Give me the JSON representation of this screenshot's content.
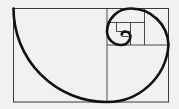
{
  "figure": {
    "name": "golden-spiral-diagram",
    "background_color": "#f2f1ef",
    "stroke_color": "#1a1a1a",
    "rect_stroke_color": "#3a3a3a",
    "spiral_stroke_color": "#111111",
    "spiral_stroke_width": 2.6,
    "square_stroke_width": 0.9,
    "outer_rect": {
      "x": 13.5,
      "y": 8.5,
      "width": 155,
      "height": 93.5
    },
    "squares": [
      {
        "label": "square-1",
        "x": 13.5,
        "y": 8.5,
        "size": 93.5,
        "fib": 89
      },
      {
        "label": "square-2",
        "x": 107.0,
        "y": 8.5,
        "size": 61.5,
        "fib": 55
      },
      {
        "label": "square-3",
        "x": 107.0,
        "y": 8.5,
        "size": 37.5,
        "fib": 34
      },
      {
        "label": "square-4",
        "x": 107.0,
        "y": 22.5,
        "size": 23.5,
        "fib": 21
      },
      {
        "label": "square-5",
        "x": 116.5,
        "y": 22.5,
        "size": 14.0,
        "fib": 13
      },
      {
        "label": "square-6",
        "x": 116.5,
        "y": 31.5,
        "size": 9.0,
        "fib": 8
      },
      {
        "label": "square-7",
        "x": 122.0,
        "y": 31.5,
        "size": 5.5,
        "fib": 5
      }
    ],
    "divider_lines": [
      {
        "label": "divider-vertical-main",
        "x1": 107.0,
        "y1": 8.5,
        "x2": 107.0,
        "y2": 102.0
      },
      {
        "label": "divider-horizontal-2",
        "x1": 107.0,
        "y1": 45.0,
        "x2": 168.5,
        "y2": 45.0
      },
      {
        "label": "divider-vertical-3",
        "x1": 144.5,
        "y1": 8.5,
        "x2": 144.5,
        "y2": 45.0
      },
      {
        "label": "divider-horizontal-4",
        "x1": 107.0,
        "y1": 22.5,
        "x2": 144.5,
        "y2": 22.5
      },
      {
        "label": "divider-vertical-5",
        "x1": 130.5,
        "y1": 22.5,
        "x2": 130.5,
        "y2": 45.0
      },
      {
        "label": "divider-horizontal-6",
        "x1": 116.5,
        "y1": 31.5,
        "x2": 130.5,
        "y2": 31.5
      },
      {
        "label": "divider-vertical-7",
        "x1": 122.0,
        "y1": 31.5,
        "x2": 122.0,
        "y2": 36.5
      },
      {
        "label": "divider-horizontal-8",
        "x1": 122.0,
        "y1": 36.5,
        "x2": 130.5,
        "y2": 36.5
      },
      {
        "label": "divider-vertical-9",
        "x1": 116.5,
        "y1": 22.5,
        "x2": 116.5,
        "y2": 31.5
      }
    ],
    "spiral_path": "M 13.5 8.5 A 93.5 93.5 0 0 0 107 102 A 61.5 61.5 0 0 0 168.5 45 A 37.5 37.5 0 0 0 130.5 8.5 A 23.5 23.5 0 0 0 107 31.5 A 14 14 0 0 0 121 45 A 9 9 0 0 0 130.5 36.5 A 5.5 5.5 0 0 0 125 31.5 A 3.5 3.5 0 0 0 121.7 34.4",
    "chart_data": {
      "type": "line",
      "title": "Golden Spiral",
      "fibonacci_sequence": [
        89,
        55,
        34,
        21,
        13,
        8,
        5
      ],
      "golden_ratio": 1.618,
      "square_count": 7,
      "grid": false,
      "xlabel": "",
      "ylabel": ""
    }
  }
}
